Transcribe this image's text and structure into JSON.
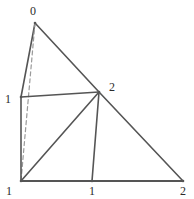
{
  "figure": {
    "kind": "simplicial-complex-diagram",
    "width": 194,
    "height": 199,
    "background_color": "#ffffff",
    "solid_edge_color": "#555555",
    "dashed_edge_color": "#9a9a9a",
    "label_color": "#2b2b2b",
    "solid_edge_width": 1.6,
    "base_edge_width": 2.2,
    "dashed_edge_width": 1.2,
    "dash_pattern": "4,3"
  },
  "vertices": [
    {
      "id": "apex",
      "label": "0",
      "x": 35,
      "y": 23,
      "label_x": 33,
      "label_y": 11
    },
    {
      "id": "left-mid",
      "label": "1",
      "x": 21,
      "y": 97,
      "label_x": 8,
      "label_y": 99
    },
    {
      "id": "bottom-left",
      "label": "1",
      "x": 21,
      "y": 181,
      "label_x": 9,
      "label_y": 191
    },
    {
      "id": "bottom-mid",
      "label": "1",
      "x": 92,
      "y": 181,
      "label_x": 92,
      "label_y": 191
    },
    {
      "id": "right-mid",
      "label": "2",
      "x": 99,
      "y": 92,
      "label_x": 112,
      "label_y": 87
    },
    {
      "id": "bottom-right",
      "label": "2",
      "x": 183,
      "y": 181,
      "label_x": 183,
      "label_y": 191
    }
  ],
  "edges": [
    {
      "id": "edge-apex-leftmid",
      "from": "apex",
      "to": "left-mid",
      "style": "solid",
      "weight": "normal"
    },
    {
      "id": "edge-apex-rightmid",
      "from": "apex",
      "to": "right-mid",
      "style": "solid",
      "weight": "normal"
    },
    {
      "id": "edge-apex-bottomleft",
      "from": "apex",
      "to": "bottom-left",
      "style": "dashed",
      "weight": "thin"
    },
    {
      "id": "edge-leftmid-bottomleft",
      "from": "left-mid",
      "to": "bottom-left",
      "style": "solid",
      "weight": "normal"
    },
    {
      "id": "edge-leftmid-rightmid",
      "from": "left-mid",
      "to": "right-mid",
      "style": "solid",
      "weight": "normal"
    },
    {
      "id": "edge-rightmid-bottomright",
      "from": "right-mid",
      "to": "bottom-right",
      "style": "solid",
      "weight": "normal"
    },
    {
      "id": "edge-rightmid-bottomleft",
      "from": "right-mid",
      "to": "bottom-left",
      "style": "solid",
      "weight": "normal"
    },
    {
      "id": "edge-rightmid-bottommid",
      "from": "right-mid",
      "to": "bottom-mid",
      "style": "solid",
      "weight": "normal"
    },
    {
      "id": "edge-bottomleft-bottomright",
      "from": "bottom-left",
      "to": "bottom-right",
      "style": "solid",
      "weight": "base"
    }
  ]
}
